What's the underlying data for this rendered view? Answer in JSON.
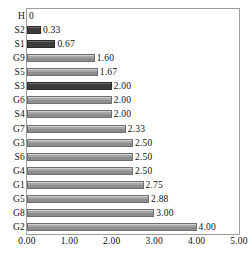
{
  "chart_data": {
    "type": "bar",
    "orientation": "horizontal",
    "title": "",
    "xlabel": "",
    "ylabel": "",
    "xlim": [
      0,
      5
    ],
    "xticks": [
      "0.00",
      "1.00",
      "2.00",
      "3.00",
      "4.00",
      "5.00"
    ],
    "xtick_values": [
      0,
      1,
      2,
      3,
      4,
      5
    ],
    "grid": false,
    "legend": "none",
    "categories": [
      "H",
      "S2",
      "S1",
      "G9",
      "S5",
      "S3",
      "G6",
      "S4",
      "G7",
      "G3",
      "S6",
      "G4",
      "G1",
      "G5",
      "G8",
      "G2"
    ],
    "values": [
      0,
      0.33,
      0.67,
      1.6,
      1.67,
      2.0,
      2.0,
      2.0,
      2.33,
      2.5,
      2.5,
      2.5,
      2.75,
      2.88,
      3.0,
      4.0
    ],
    "value_labels": [
      "0",
      "0.33",
      "0.67",
      "1.60",
      "1.67",
      "2.00",
      "2.00",
      "2.00",
      "2.33",
      "2.50",
      "2.50",
      "2.50",
      "2.75",
      "2.88",
      "3.00",
      "4.00"
    ],
    "bar_styles": [
      "light",
      "dark",
      "dark",
      "light",
      "light",
      "dark",
      "light",
      "light",
      "light",
      "light",
      "light",
      "light",
      "light",
      "light",
      "light",
      "light"
    ],
    "colors": {
      "bar_light": "#a6a6a6",
      "bar_dark": "#3c3c3c",
      "bar_edge": "#6f6f6f",
      "frame": "#9d9d9d",
      "text": "#111111",
      "background": "#ffffff"
    }
  }
}
